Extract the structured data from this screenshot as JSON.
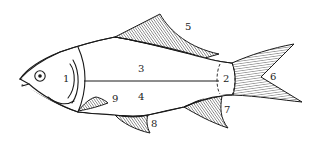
{
  "diagram": {
    "labels": [
      {
        "id": "1",
        "text": "1",
        "x": 63,
        "y": 82
      },
      {
        "id": "2",
        "text": "2",
        "x": 224,
        "y": 82
      },
      {
        "id": "3",
        "text": "3",
        "x": 138,
        "y": 72
      },
      {
        "id": "4",
        "text": "4",
        "x": 138,
        "y": 100
      },
      {
        "id": "5",
        "text": "5",
        "x": 185,
        "y": 30
      },
      {
        "id": "6",
        "text": "6",
        "x": 271,
        "y": 80
      },
      {
        "id": "7",
        "text": "7",
        "x": 224,
        "y": 113
      },
      {
        "id": "8",
        "text": "8",
        "x": 151,
        "y": 127
      },
      {
        "id": "9",
        "text": "9",
        "x": 112,
        "y": 102
      }
    ]
  }
}
